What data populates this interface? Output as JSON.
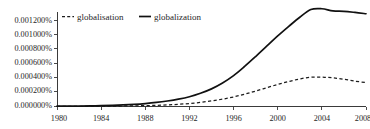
{
  "chart_data": {
    "type": "line",
    "title": "",
    "xlabel": "",
    "ylabel": "",
    "xlim": [
      1980,
      2008
    ],
    "ylim": [
      0.0,
      0.0012857
    ],
    "grid": false,
    "legend_position": "top-left",
    "x_ticks": [
      "1980",
      "1984",
      "1988",
      "1992",
      "1996",
      "2000",
      "2004",
      "2008"
    ],
    "x_tick_values": [
      1980,
      1984,
      1988,
      1992,
      1996,
      2000,
      2004,
      2008
    ],
    "y_ticks": [
      "0.000000%",
      "0.000200%",
      "0.000400%",
      "0.000600%",
      "0.000800%",
      "0.001000%",
      "0.001200%"
    ],
    "y_tick_values": [
      0.0,
      0.0002,
      0.0004,
      0.0006,
      0.0008,
      0.001,
      0.0012
    ],
    "x": [
      1980,
      1981,
      1982,
      1983,
      1984,
      1985,
      1986,
      1987,
      1988,
      1989,
      1990,
      1991,
      1992,
      1993,
      1994,
      1995,
      1996,
      1997,
      1998,
      1999,
      2000,
      2001,
      2002,
      2003,
      2004,
      2005,
      2006,
      2007,
      2008
    ],
    "series": [
      {
        "name": "globalization",
        "style": "solid",
        "color": "#111111",
        "values": [
          4e-06,
          5e-06,
          6e-06,
          8e-06,
          1.1e-05,
          1.5e-05,
          2.1e-05,
          2.9e-05,
          4e-05,
          5.5e-05,
          7.5e-05,
          0.0001,
          0.000133,
          0.00018,
          0.00024,
          0.00032,
          0.00042,
          0.000545,
          0.00068,
          0.00082,
          0.00096,
          0.00109,
          0.001215,
          0.00132,
          0.00133,
          0.0013,
          0.001295,
          0.00128,
          0.001262
        ]
      },
      {
        "name": "globalisation",
        "style": "dashed",
        "color": "#1d1d1d",
        "values": [
          2e-06,
          2e-06,
          3e-06,
          3e-06,
          4e-06,
          5e-06,
          7e-06,
          9e-06,
          1.2e-05,
          1.6e-05,
          2.2e-05,
          3e-05,
          4.1e-05,
          5.6e-05,
          7.6e-05,
          0.0001,
          0.00013,
          0.000168,
          0.00021,
          0.000255,
          0.0003,
          0.00034,
          0.000375,
          0.000398,
          0.000399,
          0.00039,
          0.00037,
          0.000345,
          0.000325
        ]
      }
    ]
  },
  "legend": {
    "entries": [
      {
        "label": "globalisation",
        "marker": "dashed-line-marker"
      },
      {
        "label": "globalization",
        "marker": "solid-line-marker"
      }
    ]
  }
}
